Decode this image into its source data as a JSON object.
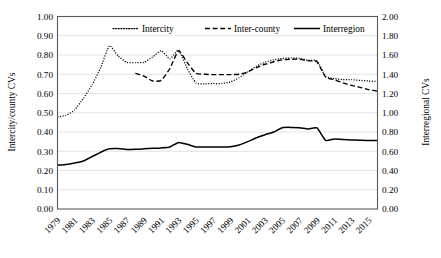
{
  "chart_data": {
    "type": "line",
    "title": "",
    "xlabel": "",
    "ylabel": "Intercity/county CVs",
    "y2label": "Interregional CVs",
    "grid": true,
    "legend_position": "top-inside",
    "ylim": [
      0.0,
      1.0
    ],
    "y2lim": [
      0.0,
      2.0
    ],
    "ytick_step": 0.1,
    "y2tick_step": 0.2,
    "yticks": [
      "0.00",
      "0.10",
      "0.20",
      "0.30",
      "0.40",
      "0.50",
      "0.60",
      "0.70",
      "0.80",
      "0.90",
      "1.00"
    ],
    "y2ticks": [
      "0.00",
      "0.20",
      "0.40",
      "0.60",
      "0.80",
      "1.00",
      "1.20",
      "1.40",
      "1.60",
      "1.80",
      "2.00"
    ],
    "x": [
      1979,
      1980,
      1981,
      1982,
      1983,
      1984,
      1985,
      1986,
      1987,
      1988,
      1989,
      1990,
      1991,
      1992,
      1993,
      1994,
      1995,
      1996,
      1997,
      1998,
      1999,
      2000,
      2001,
      2002,
      2003,
      2004,
      2005,
      2006,
      2007,
      2008,
      2009,
      2010,
      2011,
      2012,
      2013,
      2014,
      2015,
      2016
    ],
    "xtick_labels": [
      "1979",
      "1981",
      "1983",
      "1985",
      "1987",
      "1989",
      "1991",
      "1993",
      "1995",
      "1997",
      "1999",
      "2001",
      "2003",
      "2005",
      "2007",
      "2009",
      "2011",
      "2013",
      "2015"
    ],
    "xtick_rotation": -45,
    "series": [
      {
        "name": "Intercity",
        "axis": "left",
        "style": "dotted",
        "color": "#000000",
        "values": [
          0.478,
          0.487,
          0.515,
          0.575,
          0.645,
          0.735,
          0.848,
          0.795,
          0.762,
          0.76,
          0.762,
          0.79,
          0.822,
          0.78,
          0.825,
          0.73,
          0.655,
          0.65,
          0.652,
          0.652,
          0.66,
          0.682,
          0.712,
          0.742,
          0.762,
          0.775,
          0.782,
          0.785,
          0.782,
          0.772,
          0.77,
          0.69,
          0.678,
          0.672,
          0.672,
          0.668,
          0.665,
          0.662
        ]
      },
      {
        "name": "Inter-county",
        "axis": "left",
        "style": "dashed",
        "color": "#000000",
        "values": [
          null,
          null,
          null,
          null,
          null,
          null,
          null,
          null,
          null,
          0.705,
          0.69,
          0.665,
          0.668,
          0.73,
          0.822,
          0.76,
          0.705,
          0.7,
          0.698,
          0.698,
          0.698,
          0.7,
          0.712,
          0.735,
          0.752,
          0.765,
          0.775,
          0.778,
          0.778,
          0.77,
          0.765,
          0.685,
          0.672,
          0.655,
          0.642,
          0.632,
          0.62,
          0.612
        ]
      },
      {
        "name": "Interregion",
        "axis": "right",
        "style": "solid",
        "color": "#000000",
        "values": [
          0.455,
          0.462,
          0.478,
          0.498,
          0.545,
          0.59,
          0.625,
          0.628,
          0.618,
          0.62,
          0.625,
          0.63,
          0.635,
          0.645,
          0.692,
          0.672,
          0.645,
          0.645,
          0.645,
          0.645,
          0.648,
          0.665,
          0.7,
          0.74,
          0.772,
          0.8,
          0.845,
          0.848,
          0.845,
          0.832,
          0.842,
          0.712,
          0.728,
          0.722,
          0.718,
          0.715,
          0.712,
          0.712
        ]
      }
    ],
    "legend": [
      {
        "label": "Intercity",
        "style": "dotted"
      },
      {
        "label": "Inter-county",
        "style": "dashed"
      },
      {
        "label": "Interregion",
        "style": "solid"
      }
    ]
  }
}
